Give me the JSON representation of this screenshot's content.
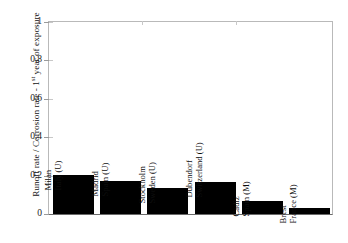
{
  "chart_data": {
    "type": "bar",
    "title": "",
    "xlabel": "",
    "ylabel": "Runoff rate / Corrosion rate - 1st year of exposure",
    "ylabel_parts": {
      "before": "Runoff rate / Corrosion rate - 1",
      "superscript": "st",
      "after": " year of exposure"
    },
    "ylim": [
      0,
      1
    ],
    "yticks": [
      0,
      0.2,
      0.4,
      0.6,
      0.8,
      1
    ],
    "ytick_labels": [
      "0",
      "0.2",
      "0.4",
      "0.6",
      "0.8",
      "1"
    ],
    "grid": false,
    "legend": "none",
    "bar_color": "#000000",
    "categories": [
      "Milan Italy (U)",
      "Madrid Spain (U)",
      "Stockholm Sweden (U)",
      "Dubendorf Switzerland (U)",
      "Cadiz Spain (M)",
      "Brest France (M)"
    ],
    "category_lines": [
      {
        "city": "Milan",
        "country": "Italy (U)"
      },
      {
        "city": "Madrid",
        "country": "Spain (U)"
      },
      {
        "city": "Stockholm",
        "country": "Sweden (U)"
      },
      {
        "city": "Dubendorf",
        "country": "Switzerland (U)"
      },
      {
        "city": "Cadiz",
        "country": "Spain (M)"
      },
      {
        "city": "Brest",
        "country": "France (M)"
      }
    ],
    "values": [
      0.203,
      0.172,
      0.135,
      0.165,
      0.068,
      0.031
    ]
  }
}
